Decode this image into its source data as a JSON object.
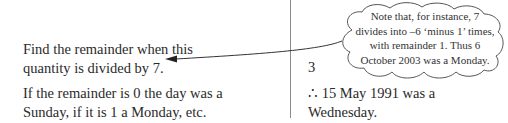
{
  "left_column": {
    "paragraph1": {
      "line1": "Find the remainder when this",
      "line2": "quantity is divided by 7."
    },
    "paragraph2": {
      "line1": "If the remainder is 0 the day was a",
      "line2": "Sunday, if it is 1 a Monday, etc."
    }
  },
  "right_column": {
    "remainder_value": "3",
    "conclusion": {
      "line1": "∴ 15 May 1991 was a",
      "line2": "Wednesday."
    }
  },
  "callout": {
    "line1": "Note that, for instance, 7",
    "line2": "divides into –6 ‘minus 1’ times,",
    "line3": "with remainder 1. Thus 6",
    "line4": "October 2003 was a Monday."
  },
  "colors": {
    "text": "#2a2a2a",
    "divider": "#8a8a8a",
    "cloud_outline": "#555555"
  }
}
